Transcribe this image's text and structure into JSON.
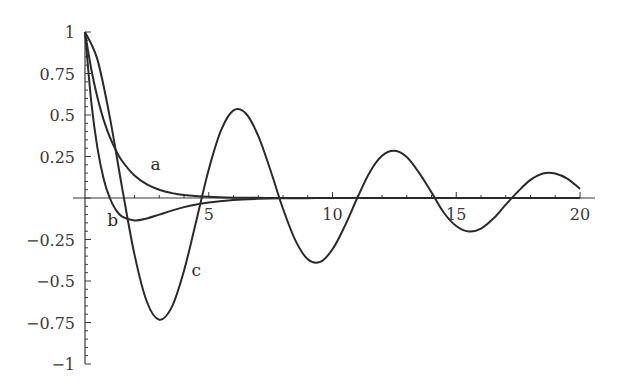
{
  "chart_data": {
    "type": "line",
    "title": "",
    "xlabel": "",
    "ylabel": "",
    "xlim": [
      0,
      20
    ],
    "ylim": [
      -1,
      1
    ],
    "grid": false,
    "legend": "none (inline curve labels a, b, c)",
    "x_ticks": [
      {
        "value": 5,
        "label": "5"
      },
      {
        "value": 10,
        "label": "10"
      },
      {
        "value": 15,
        "label": "15"
      },
      {
        "value": 20,
        "label": "20"
      }
    ],
    "y_ticks": [
      {
        "value": 1,
        "label": "1"
      },
      {
        "value": 0.75,
        "label": "0.75"
      },
      {
        "value": 0.5,
        "label": "0.5"
      },
      {
        "value": 0.25,
        "label": "0.25"
      },
      {
        "value": -0.25,
        "label": "−0.25"
      },
      {
        "value": -0.5,
        "label": "−0.5"
      },
      {
        "value": -0.75,
        "label": "−0.75"
      },
      {
        "value": -1,
        "label": "−1"
      }
    ],
    "x_minor_step": 1,
    "y_minor_step": 0.05,
    "series": [
      {
        "name": "a",
        "label_pos": {
          "x": 2.65,
          "y": 0.17
        },
        "x": [
          0,
          0.25,
          0.5,
          0.75,
          1,
          1.25,
          1.5,
          2,
          2.5,
          3,
          3.5,
          4,
          5,
          6,
          7,
          8,
          10,
          12,
          14,
          16,
          18,
          20
        ],
        "values": [
          1.0,
          0.779,
          0.607,
          0.472,
          0.368,
          0.287,
          0.223,
          0.135,
          0.082,
          0.05,
          0.03,
          0.018,
          0.007,
          0.002,
          0.001,
          0.0,
          0.0,
          0.0,
          0.0,
          0.0,
          0.0,
          0.0
        ]
      },
      {
        "name": "b",
        "label_pos": {
          "x": 0.9,
          "y": -0.17
        },
        "x": [
          0,
          0.25,
          0.5,
          0.75,
          1,
          1.25,
          1.5,
          2,
          2.5,
          3,
          3.5,
          4,
          4.5,
          5,
          6,
          7,
          8,
          9,
          10,
          12,
          14,
          16,
          18,
          20
        ],
        "values": [
          1.0,
          0.584,
          0.303,
          0.118,
          0.0,
          -0.072,
          -0.112,
          -0.135,
          -0.123,
          -0.1,
          -0.076,
          -0.055,
          -0.039,
          -0.027,
          -0.012,
          -0.005,
          -0.002,
          -0.001,
          0.0,
          0.0,
          0.0,
          0.0,
          0.0,
          0.0
        ]
      },
      {
        "name": "c",
        "label_pos": {
          "x": 4.3,
          "y": -0.47
        },
        "x": [
          0,
          0.5,
          1,
          1.5,
          2,
          2.5,
          3,
          3.5,
          4,
          4.5,
          5,
          5.5,
          6,
          6.5,
          7,
          7.5,
          8,
          8.5,
          9,
          9.5,
          10,
          10.5,
          11,
          11.5,
          12,
          12.5,
          13,
          13.5,
          14,
          14.5,
          15,
          15.5,
          16,
          16.5,
          17,
          17.5,
          18,
          18.5,
          19,
          19.5,
          20
        ],
        "values": [
          1.0,
          0.835,
          0.489,
          0.061,
          -0.341,
          -0.625,
          -0.733,
          -0.659,
          -0.438,
          -0.135,
          0.172,
          0.409,
          0.528,
          0.509,
          0.374,
          0.164,
          -0.065,
          -0.255,
          -0.369,
          -0.385,
          -0.309,
          -0.168,
          0.0,
          0.154,
          0.254,
          0.284,
          0.247,
          0.151,
          0.034,
          -0.089,
          -0.169,
          -0.202,
          -0.184,
          -0.124,
          -0.04,
          0.04,
          0.109,
          0.148,
          0.148,
          0.115,
          0.055
        ]
      }
    ]
  }
}
